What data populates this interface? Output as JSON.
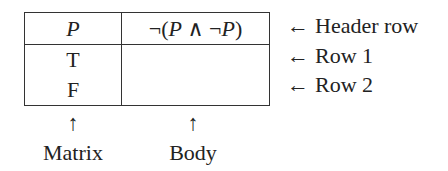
{
  "table": {
    "header": {
      "matrix": "P",
      "body": "¬(P ∧ ¬P)"
    },
    "rows": [
      {
        "matrix": "T",
        "body": ""
      },
      {
        "matrix": "F",
        "body": ""
      }
    ]
  },
  "annotations": {
    "side": [
      {
        "arrow": "←",
        "label": "Header row"
      },
      {
        "arrow": "←",
        "label": "Row 1"
      },
      {
        "arrow": "←",
        "label": "Row 2"
      }
    ],
    "bottom": [
      {
        "arrow": "↑",
        "label": "Matrix"
      },
      {
        "arrow": "↑",
        "label": "Body"
      }
    ]
  },
  "colors": {
    "line": "#333333",
    "text": "#222222",
    "background": "#ffffff"
  }
}
